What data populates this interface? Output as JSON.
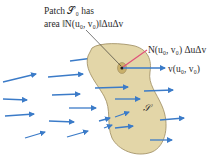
{
  "diagram": {
    "labels": {
      "patch_line1": "Patch 𝒮₀ has",
      "patch_line2": "area ‖N(u₀, v₀)‖ΔuΔv",
      "normal": "N(u₀, v₀) ΔuΔv",
      "field": "v(u₀, v₀)",
      "surface": "𝒮"
    },
    "colors": {
      "surface_fill": "#e3d6a8",
      "surface_stroke": "#9c8a5e",
      "patch_fill": "#c9b06a",
      "arrow": "#3b7bc8",
      "normal_arrow": "#e0507a",
      "leader_line": "#222222"
    }
  }
}
